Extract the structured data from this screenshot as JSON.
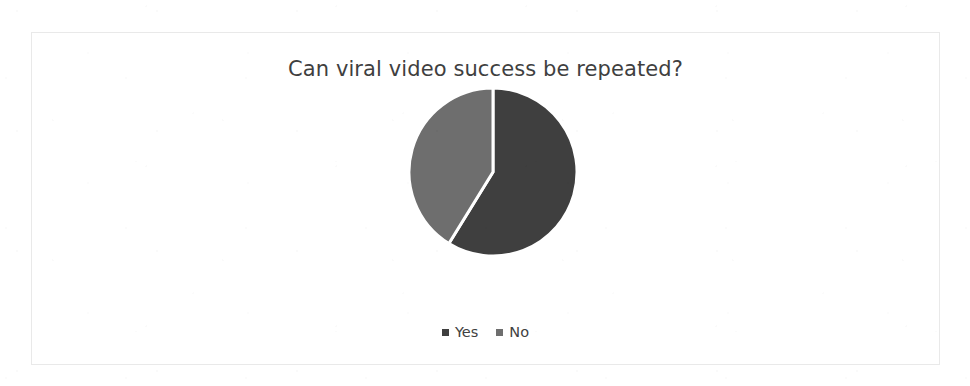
{
  "chart": {
    "title": "Can viral video success be repeated?",
    "border_color": "#e9e9e9",
    "background": "#ffffff",
    "title_color": "#3f3f3f"
  },
  "legend": {
    "items": [
      {
        "label": "Yes",
        "color": "#3f3f3f",
        "marker": "square-marker"
      },
      {
        "label": "No",
        "color": "#6e6e6e",
        "marker": "square-marker"
      }
    ]
  },
  "chart_data": {
    "type": "pie",
    "title": "Can viral video success be repeated?",
    "categories": [
      "Yes",
      "No"
    ],
    "values": [
      58.8,
      41.2
    ],
    "unit": "percent",
    "colors": [
      "#3f3f3f",
      "#6e6e6e"
    ],
    "slice_border_color": "#ffffff",
    "slice_border_width": 3,
    "start_angle_deg": 0,
    "direction": "clockwise",
    "legend_position": "bottom",
    "data_labels": false,
    "grid": false,
    "xlabel": "",
    "ylabel": ""
  }
}
